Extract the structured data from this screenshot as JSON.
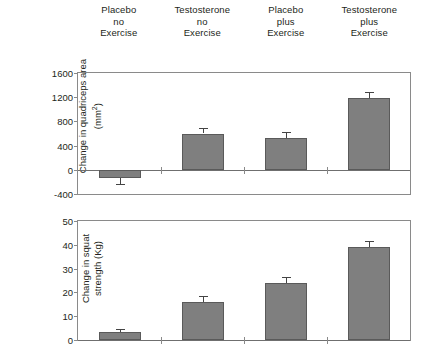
{
  "figure": {
    "group_labels": [
      [
        "Placebo",
        "no",
        "Exercise"
      ],
      [
        "Testosterone",
        "no",
        "Exercise"
      ],
      [
        "Placebo",
        "plus",
        "Exercise"
      ],
      [
        "Testosterone",
        "plus",
        "Exercise"
      ]
    ],
    "bar_color": "#7f7f7f",
    "bar_edge_color": "#5a5a5a",
    "frame_color": "#8a8a8a"
  },
  "chart_data": [
    {
      "type": "bar",
      "title": "",
      "xlabel": "",
      "ylabel": "Change in quadriceps area (mm2)",
      "ylabel_lines": [
        "Change in quadriceps area",
        "(mm²)"
      ],
      "categories": [
        "Placebo no Exercise",
        "Testosterone no Exercise",
        "Placebo plus Exercise",
        "Testosterone plus Exercise"
      ],
      "values": [
        -130,
        600,
        530,
        1190
      ],
      "errors": [
        100,
        90,
        90,
        90
      ],
      "ylim": [
        -400,
        1600
      ],
      "yticks": [
        -400,
        0,
        400,
        800,
        1200,
        1600
      ],
      "ytick_labels": [
        "-400",
        "0",
        "400",
        "800",
        "1200",
        "1600"
      ],
      "grid": false,
      "legend": "none"
    },
    {
      "type": "bar",
      "title": "",
      "xlabel": "",
      "ylabel": "Change in squat strength (Kg)",
      "ylabel_lines": [
        "Change in squat",
        "strength (Kg)"
      ],
      "categories": [
        "Placebo no Exercise",
        "Testosterone no Exercise",
        "Placebo plus Exercise",
        "Testosterone plus Exercise"
      ],
      "values": [
        3.5,
        16,
        24,
        39
      ],
      "errors": [
        1.2,
        2.5,
        2.5,
        2.8
      ],
      "ylim": [
        0,
        50
      ],
      "yticks": [
        0,
        10,
        20,
        30,
        40,
        50
      ],
      "ytick_labels": [
        "0",
        "10",
        "20",
        "30",
        "40",
        "50"
      ],
      "grid": false,
      "legend": "none"
    }
  ]
}
